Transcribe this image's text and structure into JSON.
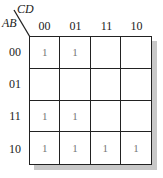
{
  "kmap": {
    "row_variable": "AB",
    "col_variable": "CD",
    "col_labels": [
      "00",
      "01",
      "11",
      "10"
    ],
    "row_labels": [
      "00",
      "01",
      "11",
      "10"
    ],
    "cells": [
      [
        "1",
        "1",
        "",
        ""
      ],
      [
        "",
        "",
        "",
        ""
      ],
      [
        "1",
        "1",
        "",
        ""
      ],
      [
        "1",
        "1",
        "1",
        "1"
      ]
    ]
  }
}
